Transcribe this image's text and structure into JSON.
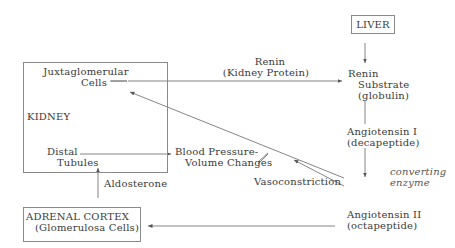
{
  "diagram": {
    "kidney": {
      "label": "KIDNEY",
      "juxtaglomerular_line1": "Juxtaglomerular",
      "juxtaglomerular_line2": "Cells",
      "distal_line1": "Distal",
      "distal_line2": "Tubules"
    },
    "liver": {
      "label": "LIVER"
    },
    "renin": {
      "line1": "Renin",
      "line2": "(Kidney Protein)"
    },
    "renin_substrate": {
      "line1": "Renin",
      "line2": "Substrate",
      "line3": "(globulin)"
    },
    "angiotensin_1": {
      "line1": "Angiotensin I",
      "line2": "(decapeptide)"
    },
    "converting_enzyme": {
      "line1": "converting",
      "line2": "enzyme"
    },
    "angiotensin_2": {
      "line1": "Angiotensin II",
      "line2": "(octapeptide)"
    },
    "vasoconstriction": {
      "label": "Vasoconstriction"
    },
    "blood_pressure": {
      "line1": "Blood Pressure-",
      "line2": "Volume Changes"
    },
    "aldosterone": {
      "label": "Aldosterone"
    },
    "adrenal_cortex": {
      "line1": "ADRENAL CORTEX",
      "line2": "(Glomerulosa Cells)"
    }
  }
}
